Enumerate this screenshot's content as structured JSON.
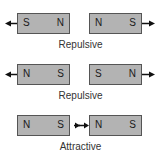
{
  "rows": [
    {
      "left_magnet": {
        "left_pole": "S",
        "right_pole": "N"
      },
      "right_magnet": {
        "left_pole": "N",
        "right_pole": "S"
      },
      "caption": "Repulsive",
      "force_arrows": "outward"
    },
    {
      "left_magnet": {
        "left_pole": "N",
        "right_pole": "S"
      },
      "right_magnet": {
        "left_pole": "S",
        "right_pole": "N"
      },
      "caption": "Repulsive",
      "force_arrows": "outward"
    },
    {
      "left_magnet": {
        "left_pole": "N",
        "right_pole": "S"
      },
      "right_magnet": {
        "left_pole": "N",
        "right_pole": "S"
      },
      "caption": "Attractive",
      "force_arrows": "inward"
    }
  ],
  "colors": {
    "magnet_fill": "#b3b3b3",
    "magnet_border": "#555555",
    "arrow": "#111111"
  }
}
